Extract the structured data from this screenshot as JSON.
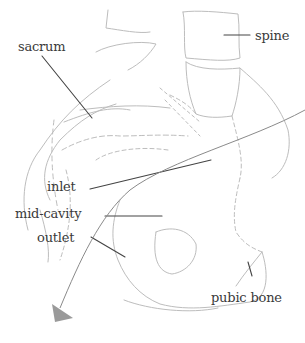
{
  "diagram": {
    "type": "anatomical illustration",
    "labels": {
      "sacrum": "sacrum",
      "spine": "spine",
      "inlet": "inlet",
      "mid_cavity": "mid-cavity",
      "outlet": "outlet",
      "pubic_bone": "pubic bone"
    },
    "colors": {
      "outline": "#b8b8b8",
      "leader": "#444444",
      "text": "#3a3a3a",
      "arrow": "#8a8a8a"
    }
  }
}
